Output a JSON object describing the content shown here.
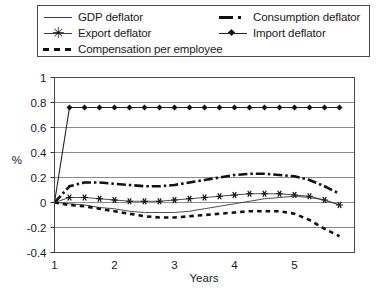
{
  "legend": {
    "entries": [
      {
        "label": "GDP deflator",
        "style": "solid-thin",
        "icon": "line-solid-thin-icon"
      },
      {
        "label": "Consumption deflator",
        "style": "dashdot-thick",
        "icon": "line-dash-dot-icon"
      },
      {
        "label": "Export deflator",
        "style": "star",
        "icon": "line-asterisk-marker-icon"
      },
      {
        "label": "Import deflator",
        "style": "diamond",
        "icon": "line-diamond-marker-icon"
      },
      {
        "label": "Compensation per employee",
        "style": "dotted-thick",
        "icon": "line-dashed-thick-icon"
      }
    ],
    "star_glyph": "✳"
  },
  "chart_data": {
    "type": "line",
    "title": "",
    "xlabel": "Years",
    "ylabel": "%",
    "xlim": [
      1,
      6
    ],
    "ylim": [
      -0.4,
      1
    ],
    "grid": true,
    "legend_position": "top",
    "xticks": [
      1,
      2,
      3,
      4,
      5
    ],
    "xticklabels": [
      "1",
      "2",
      "3",
      "4",
      "5"
    ],
    "yticks": [
      1,
      0.8,
      0.6,
      0.4,
      0.2,
      0,
      -0.2,
      -0.4
    ],
    "yticklabels": [
      "1",
      "0.8",
      "0.6",
      "0.4",
      "0.2",
      "0",
      "-0.2",
      "-0.4"
    ],
    "x": [
      1,
      1.25,
      1.5,
      1.75,
      2,
      2.25,
      2.5,
      2.75,
      3,
      3.25,
      3.5,
      3.75,
      4,
      4.25,
      4.5,
      4.75,
      5,
      5.25,
      5.5,
      5.75
    ],
    "series": [
      {
        "name": "Import deflator",
        "style": "diamond",
        "values": [
          0,
          0.76,
          0.76,
          0.76,
          0.76,
          0.76,
          0.76,
          0.76,
          0.76,
          0.76,
          0.76,
          0.76,
          0.76,
          0.76,
          0.76,
          0.76,
          0.76,
          0.76,
          0.76,
          0.76
        ]
      },
      {
        "name": "Consumption deflator",
        "style": "dashdot-thick",
        "values": [
          0,
          0.13,
          0.16,
          0.16,
          0.15,
          0.14,
          0.13,
          0.13,
          0.14,
          0.16,
          0.18,
          0.2,
          0.22,
          0.23,
          0.23,
          0.22,
          0.21,
          0.18,
          0.13,
          0.07
        ]
      },
      {
        "name": "Export deflator",
        "style": "star",
        "values": [
          0,
          0.04,
          0.04,
          0.03,
          0.02,
          0.01,
          0.01,
          0.01,
          0.02,
          0.03,
          0.04,
          0.05,
          0.06,
          0.07,
          0.07,
          0.07,
          0.06,
          0.05,
          0.02,
          -0.02
        ]
      },
      {
        "name": "GDP deflator",
        "style": "solid-thin",
        "values": [
          0,
          -0.01,
          -0.02,
          -0.04,
          -0.05,
          -0.07,
          -0.08,
          -0.08,
          -0.08,
          -0.07,
          -0.05,
          -0.03,
          -0.01,
          0.01,
          0.03,
          0.04,
          0.05,
          0.04,
          0.02,
          -0.02
        ]
      },
      {
        "name": "Compensation per employee",
        "style": "dotted-thick",
        "values": [
          0,
          -0.02,
          -0.03,
          -0.05,
          -0.07,
          -0.09,
          -0.11,
          -0.12,
          -0.12,
          -0.11,
          -0.1,
          -0.09,
          -0.08,
          -0.07,
          -0.07,
          -0.07,
          -0.09,
          -0.14,
          -0.21,
          -0.27
        ]
      }
    ]
  }
}
